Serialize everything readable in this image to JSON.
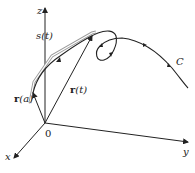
{
  "figure": {
    "axes": {
      "x_label": "x",
      "y_label": "y",
      "z_label": "z",
      "origin_label": "0"
    },
    "vectors": [
      {
        "label_bold": "r",
        "label_rest": "(a)"
      },
      {
        "label_bold": "r",
        "label_rest": "(t)"
      }
    ],
    "arc_length_label": "s(t)",
    "curve_label": "C",
    "colors": {
      "line": "#222222",
      "bracket": "#9a9a9a"
    }
  }
}
